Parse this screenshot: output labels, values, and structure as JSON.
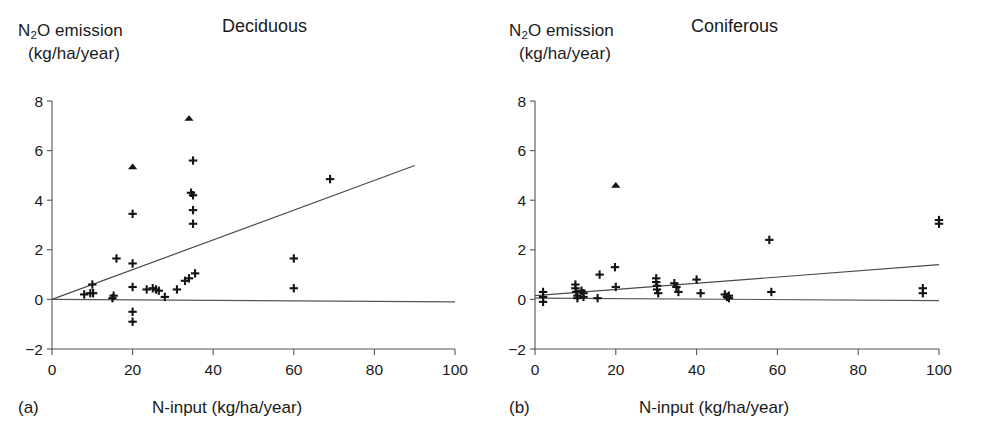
{
  "figure": {
    "background": "#ffffff",
    "axis_color": "#555555",
    "marker_color": "#141414"
  },
  "panels": [
    {
      "letter": "(a)",
      "title": "Deciduous",
      "ylabel_line1_pre": "N",
      "ylabel_line1_sub": "2",
      "ylabel_line1_post": "O emission",
      "ylabel_line2": "(kg/ha/year)",
      "xlabel": "N-input (kg/ha/year)"
    },
    {
      "letter": "(b)",
      "title": "Coniferous",
      "ylabel_line1_pre": "N",
      "ylabel_line1_sub": "2",
      "ylabel_line1_post": "O emission",
      "ylabel_line2": "(kg/ha/year)",
      "xlabel": "N-input (kg/ha/year)"
    }
  ],
  "chart_data": [
    {
      "type": "scatter",
      "panel": "(a)",
      "title": "Deciduous",
      "xlabel": "N-input (kg/ha/year)",
      "ylabel": "N2O emission (kg/ha/year)",
      "xlim": [
        0,
        100
      ],
      "ylim": [
        -2,
        8
      ],
      "xticks": [
        0,
        20,
        40,
        60,
        80,
        100
      ],
      "yticks": [
        -2,
        0,
        2,
        4,
        6,
        8
      ],
      "grid": false,
      "legend": "none",
      "series": [
        {
          "name": "plus-markers",
          "marker": "plus",
          "points": [
            [
              8.0,
              0.2
            ],
            [
              9.5,
              0.25
            ],
            [
              10.0,
              0.6
            ],
            [
              10.2,
              0.25
            ],
            [
              15.0,
              0.05
            ],
            [
              15.3,
              0.15
            ],
            [
              16.0,
              1.65
            ],
            [
              20.0,
              3.45
            ],
            [
              20.0,
              1.45
            ],
            [
              20.0,
              0.5
            ],
            [
              20.0,
              -0.5
            ],
            [
              20.0,
              -0.9
            ],
            [
              23.5,
              0.4
            ],
            [
              25.0,
              0.45
            ],
            [
              25.8,
              0.4
            ],
            [
              26.5,
              0.35
            ],
            [
              28.0,
              0.1
            ],
            [
              31.0,
              0.4
            ],
            [
              33.0,
              0.75
            ],
            [
              34.0,
              0.85
            ],
            [
              34.5,
              4.3
            ],
            [
              35.0,
              4.2
            ],
            [
              35.0,
              5.6
            ],
            [
              35.0,
              3.6
            ],
            [
              35.0,
              3.05
            ],
            [
              35.5,
              1.05
            ],
            [
              60.0,
              1.65
            ],
            [
              60.0,
              0.45
            ],
            [
              69.0,
              4.85
            ]
          ]
        },
        {
          "name": "triangle-markers",
          "marker": "triangle",
          "points": [
            [
              20.0,
              5.35
            ],
            [
              34.0,
              7.3
            ]
          ]
        }
      ],
      "lines": [
        {
          "name": "regression-line",
          "x": [
            0,
            90
          ],
          "y": [
            0.0,
            5.4
          ]
        },
        {
          "name": "zero-reference-line",
          "x": [
            0,
            100
          ],
          "y": [
            0.0,
            -0.1
          ]
        }
      ]
    },
    {
      "type": "scatter",
      "panel": "(b)",
      "title": "Coniferous",
      "xlabel": "N-input (kg/ha/year)",
      "ylabel": "N2O emission (kg/ha/year)",
      "xlim": [
        0,
        100
      ],
      "ylim": [
        -2,
        8
      ],
      "xticks": [
        0,
        20,
        40,
        60,
        80,
        100
      ],
      "yticks": [
        -2,
        0,
        2,
        4,
        6,
        8
      ],
      "grid": false,
      "legend": "none",
      "series": [
        {
          "name": "plus-markers",
          "marker": "plus",
          "points": [
            [
              2.0,
              0.3
            ],
            [
              2.0,
              0.1
            ],
            [
              2.0,
              -0.1
            ],
            [
              10.0,
              0.6
            ],
            [
              10.0,
              0.45
            ],
            [
              10.2,
              0.3
            ],
            [
              10.5,
              0.15
            ],
            [
              10.5,
              0.05
            ],
            [
              11.5,
              0.35
            ],
            [
              12.0,
              0.25
            ],
            [
              12.0,
              0.1
            ],
            [
              15.5,
              0.05
            ],
            [
              16.0,
              1.0
            ],
            [
              19.8,
              1.3
            ],
            [
              20.0,
              0.5
            ],
            [
              30.0,
              0.85
            ],
            [
              30.0,
              0.7
            ],
            [
              30.2,
              0.55
            ],
            [
              30.2,
              0.4
            ],
            [
              30.5,
              0.25
            ],
            [
              34.5,
              0.65
            ],
            [
              35.0,
              0.5
            ],
            [
              35.5,
              0.3
            ],
            [
              40.0,
              0.8
            ],
            [
              41.0,
              0.25
            ],
            [
              47.0,
              0.2
            ],
            [
              47.5,
              0.1
            ],
            [
              48.0,
              0.15
            ],
            [
              48.0,
              0.05
            ],
            [
              58.0,
              2.4
            ],
            [
              58.5,
              0.3
            ],
            [
              96.0,
              0.45
            ],
            [
              96.0,
              0.25
            ],
            [
              100.0,
              3.2
            ],
            [
              100.0,
              3.05
            ]
          ]
        },
        {
          "name": "triangle-markers",
          "marker": "triangle",
          "points": [
            [
              20.0,
              4.6
            ]
          ]
        }
      ],
      "lines": [
        {
          "name": "regression-line",
          "x": [
            0,
            100
          ],
          "y": [
            0.15,
            1.4
          ]
        },
        {
          "name": "zero-reference-line",
          "x": [
            0,
            100
          ],
          "y": [
            0.05,
            -0.05
          ]
        }
      ]
    }
  ]
}
